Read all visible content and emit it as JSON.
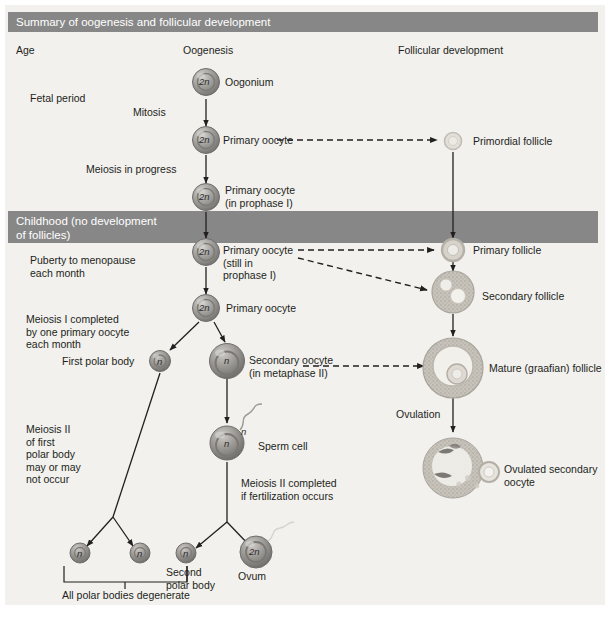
{
  "figure": {
    "title": "Summary of oogenesis and follicular development",
    "columns": [
      {
        "label": "Age"
      },
      {
        "label": "Oogenesis"
      },
      {
        "label": "Follicular development"
      }
    ],
    "colors": {
      "banner": "#878787",
      "panel_background": "#f2f1ee",
      "text": "#231f20",
      "banner_text": "#ffffff",
      "arrow": "#231f20",
      "cell_fill": "#9d9d9d",
      "cell_stroke": "#6e6e6e",
      "follicle_fill": "#c9c6c0",
      "follicle_stroke": "#a9a59e"
    },
    "age_labels": [
      {
        "id": "fetal",
        "text": "Fetal period"
      },
      {
        "id": "childhood",
        "text": "Childhood (no development\nof follicles)"
      },
      {
        "id": "puberty",
        "text": "Puberty to menopause\neach month"
      }
    ],
    "oogenesis": {
      "cells": [
        {
          "id": "oogonium",
          "ploidy": "2n",
          "label": "Oogonium"
        },
        {
          "id": "primary-oocyte-1",
          "ploidy": "2n",
          "label": "Primary oocyte"
        },
        {
          "id": "primary-oocyte-prophase",
          "ploidy": "2n",
          "label": "Primary oocyte\n(in prophase I)"
        },
        {
          "id": "primary-oocyte-still",
          "ploidy": "2n",
          "label": "Primary oocyte\n(still in\nprophase I)"
        },
        {
          "id": "primary-oocyte-4",
          "ploidy": "2n",
          "label": "Primary oocyte"
        },
        {
          "id": "first-polar-body",
          "ploidy": "n",
          "label": "First polar body"
        },
        {
          "id": "secondary-oocyte",
          "ploidy": "n",
          "label": "Secondary oocyte\n(in metaphase II)"
        },
        {
          "id": "fertilized-oocyte",
          "ploidy": "n",
          "label": ""
        },
        {
          "id": "polar-body-a",
          "ploidy": "n",
          "label": ""
        },
        {
          "id": "polar-body-b",
          "ploidy": "n",
          "label": ""
        },
        {
          "id": "second-polar-body",
          "ploidy": "n",
          "label": "Second\npolar body"
        },
        {
          "id": "ovum",
          "ploidy": "2n",
          "label": "Ovum"
        }
      ],
      "process_labels": [
        {
          "id": "mitosis",
          "text": "Mitosis"
        },
        {
          "id": "meiosis-in-progress",
          "text": "Meiosis in progress"
        },
        {
          "id": "meiosis-i-completed",
          "text": "Meiosis I completed\nby one primary oocyte\neach month"
        },
        {
          "id": "meiosis-ii-polar",
          "text": "Meiosis II\nof first\npolar body\nmay or may\nnot occur"
        },
        {
          "id": "sperm-cell",
          "text": "Sperm cell"
        },
        {
          "id": "meiosis-ii-completed",
          "text": "Meiosis II completed\nif fertilization occurs"
        },
        {
          "id": "degenerate",
          "text": "All polar bodies degenerate"
        }
      ]
    },
    "follicular": {
      "stages": [
        {
          "id": "primordial-follicle",
          "label": "Primordial follicle"
        },
        {
          "id": "primary-follicle",
          "label": "Primary follicle"
        },
        {
          "id": "secondary-follicle",
          "label": "Secondary follicle"
        },
        {
          "id": "mature-follicle",
          "label": "Mature (graafian) follicle"
        },
        {
          "id": "ovulated-oocyte",
          "label": "Ovulated secondary\noocyte"
        }
      ],
      "process_labels": [
        {
          "id": "ovulation",
          "text": "Ovulation"
        }
      ]
    }
  }
}
